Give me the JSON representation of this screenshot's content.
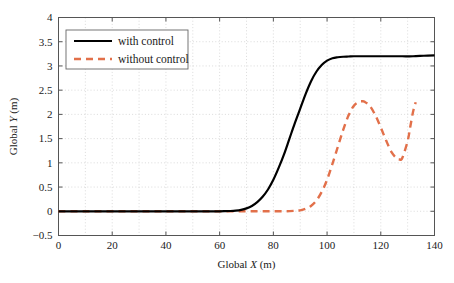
{
  "chart_data": {
    "type": "line",
    "title": "",
    "xlabel": "Global X (m)",
    "xlabel_parts": {
      "prefix": "Global ",
      "symbol": "X",
      "suffix": " (m)"
    },
    "ylabel": "Global Y (m)",
    "ylabel_parts": {
      "prefix": "Global ",
      "symbol": "Y",
      "suffix": " (m)"
    },
    "xlim": [
      0,
      140
    ],
    "ylim": [
      -0.5,
      4
    ],
    "xticks": [
      0,
      20,
      40,
      60,
      80,
      100,
      120,
      140
    ],
    "xtick_labels": [
      "0",
      "20",
      "40",
      "60",
      "80",
      "100",
      "120",
      "140"
    ],
    "yticks": [
      -0.5,
      0,
      0.5,
      1,
      1.5,
      2,
      2.5,
      3,
      3.5,
      4
    ],
    "ytick_labels": [
      "−0.5",
      "0",
      "0.5",
      "1",
      "1.5",
      "2",
      "2.5",
      "3",
      "3.5",
      "4"
    ],
    "grid": true,
    "grid_style": "dotted",
    "grid_color": "#cccccc",
    "legend_position": "top-left",
    "axes_color": "#555555",
    "series": [
      {
        "name": "with control",
        "label": "with control",
        "color": "#000000",
        "style": "solid",
        "width": 2.2,
        "x": [
          0,
          5,
          10,
          15,
          20,
          25,
          30,
          35,
          40,
          45,
          50,
          55,
          60,
          62,
          64,
          66,
          68,
          70,
          72,
          74,
          76,
          78,
          80,
          82,
          84,
          86,
          88,
          90,
          92,
          94,
          96,
          98,
          100,
          102,
          104,
          106,
          108,
          110,
          112,
          114,
          116,
          120,
          124,
          128,
          132,
          136,
          140
        ],
        "y": [
          0,
          0,
          0,
          0,
          0,
          0,
          0,
          0,
          0,
          0,
          0,
          0,
          0,
          0.002,
          0.006,
          0.014,
          0.03,
          0.06,
          0.11,
          0.19,
          0.3,
          0.45,
          0.65,
          0.9,
          1.18,
          1.5,
          1.82,
          2.12,
          2.42,
          2.68,
          2.88,
          3.02,
          3.11,
          3.16,
          3.18,
          3.19,
          3.195,
          3.2,
          3.2,
          3.2,
          3.2,
          3.2,
          3.2,
          3.2,
          3.2,
          3.21,
          3.22
        ]
      },
      {
        "name": "without control",
        "label": "without control",
        "color": "#e2704a",
        "style": "dashed",
        "width": 2.4,
        "dash": "7,5",
        "x": [
          0,
          10,
          20,
          30,
          40,
          50,
          60,
          70,
          78,
          84,
          88,
          90,
          92,
          94,
          96,
          98,
          100,
          102,
          104,
          106,
          108,
          110,
          112,
          113,
          114,
          116,
          118,
          120,
          122,
          124,
          126,
          127,
          128,
          130,
          131,
          132,
          133
        ],
        "y": [
          0,
          0,
          0,
          0,
          0,
          0,
          0,
          0,
          0,
          0,
          0.01,
          0.02,
          0.05,
          0.11,
          0.22,
          0.4,
          0.65,
          0.98,
          1.33,
          1.68,
          1.98,
          2.18,
          2.26,
          2.27,
          2.26,
          2.17,
          1.98,
          1.73,
          1.46,
          1.22,
          1.09,
          1.07,
          1.1,
          1.45,
          1.75,
          2.05,
          2.25
        ]
      }
    ]
  }
}
